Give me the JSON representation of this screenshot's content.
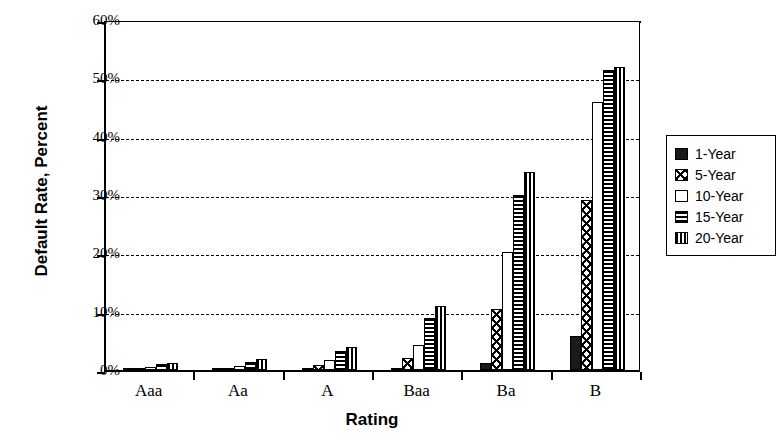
{
  "chart_data": {
    "type": "bar",
    "title": "",
    "xlabel": "Rating",
    "ylabel": "Default Rate, Percent",
    "categories": [
      "Aaa",
      "Aa",
      "A",
      "Baa",
      "Ba",
      "B"
    ],
    "ylim": [
      0,
      60
    ],
    "yticks": [
      0,
      10,
      20,
      30,
      40,
      50,
      60
    ],
    "ytick_labels": [
      "0%",
      "10%",
      "20%",
      "30%",
      "40%",
      "50%",
      "60%"
    ],
    "grid": true,
    "legend_position": "right",
    "series": [
      {
        "name": "1-Year",
        "pattern": "solid",
        "values": [
          0.0,
          0.0,
          0.1,
          0.3,
          1.2,
          5.8
        ]
      },
      {
        "name": "5-Year",
        "pattern": "cross",
        "values": [
          0.1,
          0.2,
          0.8,
          2.0,
          10.5,
          29.2
        ]
      },
      {
        "name": "10-Year",
        "pattern": "empty",
        "values": [
          0.6,
          0.7,
          1.8,
          4.3,
          20.2,
          46.0
        ]
      },
      {
        "name": "15-Year",
        "pattern": "hlines",
        "values": [
          1.1,
          1.4,
          3.3,
          9.0,
          30.0,
          51.5
        ]
      },
      {
        "name": "20-Year",
        "pattern": "vlines",
        "values": [
          1.2,
          1.9,
          4.0,
          11.0,
          34.0,
          52.0
        ]
      }
    ]
  },
  "legend": {
    "items": [
      {
        "label": "1-Year",
        "pattern": "solid"
      },
      {
        "label": "5-Year",
        "pattern": "cross"
      },
      {
        "label": "10-Year",
        "pattern": "empty"
      },
      {
        "label": "15-Year",
        "pattern": "hlines"
      },
      {
        "label": "20-Year",
        "pattern": "vlines"
      }
    ]
  }
}
